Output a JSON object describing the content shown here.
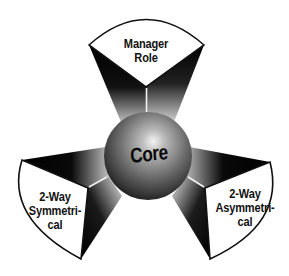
{
  "diagram": {
    "title": "",
    "center": {
      "label": "Core"
    },
    "arms": [
      {
        "position": "top",
        "lines": [
          "Manager",
          "Role"
        ]
      },
      {
        "position": "bottom-left",
        "lines": [
          "2-Way",
          "Symmetri-",
          "cal"
        ]
      },
      {
        "position": "bottom-right",
        "lines": [
          "2-Way",
          "Asymmetri-",
          "cal"
        ]
      }
    ],
    "colors": {
      "panel_fill": "#ffffff",
      "panel_stroke": "#111111",
      "wedge_dark": "#000000",
      "wedge_light": "#ffffff",
      "sphere_highlight": "#e8e8e8",
      "sphere_shadow": "#1a1a1a"
    }
  }
}
